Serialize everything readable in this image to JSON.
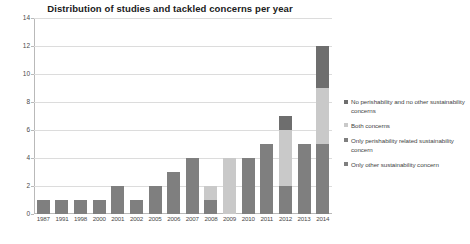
{
  "chart_data": {
    "type": "bar",
    "subtype": "stacked-bar",
    "title": "Distribution of studies and tackled concerns per year",
    "xlabel": "",
    "ylabel": "",
    "ylim": [
      0,
      14
    ],
    "yticks": [
      0,
      2,
      4,
      6,
      8,
      10,
      12,
      14
    ],
    "grid": true,
    "legend_position": "right",
    "categories": [
      "1987",
      "1991",
      "1998",
      "2000",
      "2001",
      "2002",
      "2005",
      "2006",
      "2007",
      "2008",
      "2009",
      "2010",
      "2011",
      "2012",
      "2013",
      "2014"
    ],
    "series": [
      {
        "name": "Only other sustainability concern",
        "color": "#7f7f7f",
        "values": [
          1,
          1,
          1,
          1,
          2,
          1,
          2,
          3,
          4,
          1,
          0,
          4,
          5,
          2,
          5,
          5
        ]
      },
      {
        "name": "Only perishability related sustainability concern",
        "color": "#7f7f7f",
        "values": [
          0,
          0,
          0,
          0,
          0,
          0,
          0,
          0,
          0,
          0,
          0,
          0,
          0,
          0,
          0,
          0
        ]
      },
      {
        "name": "Both concerns",
        "color": "#c9c9c9",
        "values": [
          0,
          0,
          0,
          0,
          0,
          0,
          0,
          0,
          0,
          1,
          4,
          0,
          0,
          4,
          0,
          4
        ]
      },
      {
        "name": "No perishability and no other sustainability concerns",
        "color": "#6e6e6e",
        "values": [
          0,
          0,
          0,
          0,
          0,
          0,
          0,
          0,
          0,
          0,
          0,
          0,
          0,
          1,
          0,
          3
        ]
      }
    ],
    "totals": [
      1,
      1,
      1,
      1,
      2,
      1,
      2,
      3,
      4,
      2,
      4,
      4,
      5,
      7,
      5,
      12
    ]
  },
  "legend": {
    "items": [
      {
        "label": "No perishability and no other sustainability concerns",
        "color": "#6e6e6e"
      },
      {
        "label": "Both concerns",
        "color": "#c9c9c9"
      },
      {
        "label": "Only perishability related sustainability concern",
        "color": "#7f7f7f"
      },
      {
        "label": "Only other sustainability concern",
        "color": "#7f7f7f"
      }
    ]
  },
  "axis": {
    "y_tick_labels": [
      "0",
      "2",
      "4",
      "6",
      "8",
      "10",
      "12",
      "14"
    ]
  },
  "colors": {
    "grid": "#dcdcdc",
    "axis": "#b9b9b9",
    "text": "#4a4a4a",
    "title": "#202020",
    "background": "#ffffff"
  }
}
